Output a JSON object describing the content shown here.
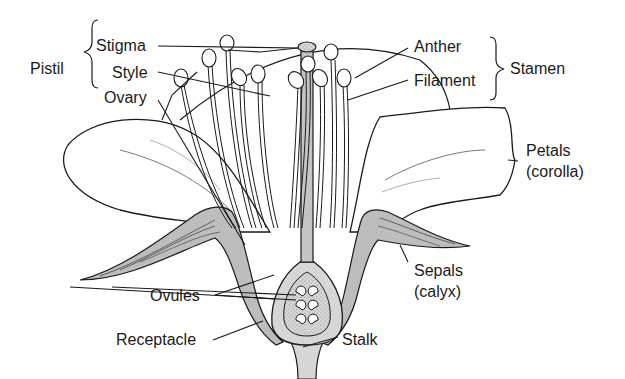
{
  "diagram": {
    "colors": {
      "line": "#1a1a1a",
      "fill_gray": "#bdbdbd",
      "fill_light": "#e0e0e0",
      "background": "#ffffff"
    },
    "groups": {
      "pistil": {
        "label": "Pistil",
        "members": [
          "Stigma",
          "Style",
          "Ovary"
        ]
      },
      "stamen": {
        "label": "Stamen",
        "members": [
          "Anther",
          "Filament"
        ]
      }
    },
    "labels": {
      "stigma": "Stigma",
      "style": "Style",
      "ovary": "Ovary",
      "pistil": "Pistil",
      "anther": "Anther",
      "filament": "Filament",
      "stamen": "Stamen",
      "petals": "Petals",
      "petals_sub": "(corolla)",
      "sepals": "Sepals",
      "sepals_sub": "(calyx)",
      "ovules": "Ovules",
      "receptacle": "Receptacle",
      "stalk": "Stalk"
    }
  }
}
